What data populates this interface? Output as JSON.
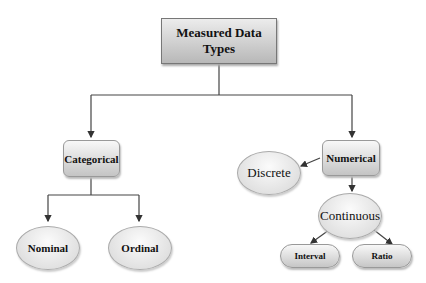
{
  "title": "Measured Data Types",
  "nodes": {
    "root": "Measured Data Types",
    "categorical": "Categorical",
    "numerical": "Numerical",
    "nominal": "Nominal",
    "ordinal": "Ordinal",
    "discrete": "Discrete",
    "continuous": "Continuous",
    "interval": "Interval",
    "ratio": "Ratio"
  },
  "edges": [
    [
      "Measured Data Types",
      "Categorical"
    ],
    [
      "Measured Data Types",
      "Numerical"
    ],
    [
      "Categorical",
      "Nominal"
    ],
    [
      "Categorical",
      "Ordinal"
    ],
    [
      "Numerical",
      "Discrete"
    ],
    [
      "Numerical",
      "Continuous"
    ],
    [
      "Continuous",
      "Interval"
    ],
    [
      "Continuous",
      "Ratio"
    ]
  ]
}
